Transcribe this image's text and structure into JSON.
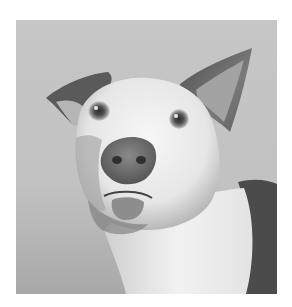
{
  "image": {
    "subject": "dog",
    "description": "Grayscale portrait of a white dog with dark ears and a dark patch on the shoulder, one ear folded and one ear upright, looking up with mouth slightly open",
    "style": "grayscale photograph",
    "frame": {
      "x": 16,
      "y": 20,
      "width": 261,
      "height": 274
    },
    "colors": {
      "page_background": "#ffffff",
      "backdrop": "#c4c4c4",
      "backdrop_light": "#d2d2d2",
      "backdrop_dark": "#a9a9a9",
      "fur_white": "#f0f0f0",
      "fur_shadow": "#bdbdbd",
      "ear_dark": "#5a5a5a",
      "nose": "#6e6e6e",
      "patch_dark": "#4a4a4a"
    }
  }
}
